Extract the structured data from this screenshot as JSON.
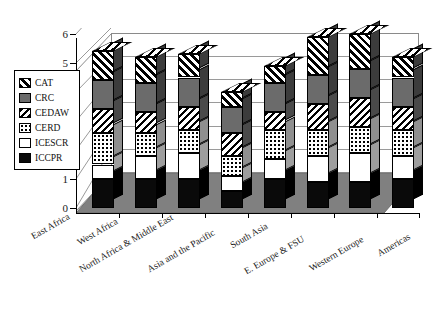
{
  "chart_data": {
    "type": "bar",
    "subtype": "stacked-bar-3d",
    "title": "",
    "subtitle": "",
    "xlabel": "",
    "ylabel": "",
    "ylim": [
      0,
      6
    ],
    "yticks": [
      0,
      1,
      2,
      3,
      4,
      5,
      6
    ],
    "ytick_labels": [
      "0",
      "1",
      "2",
      "3",
      "4",
      "5",
      "6"
    ],
    "grid": true,
    "legend_position": "left",
    "categories": [
      "East Africa",
      "West Africa",
      "North Africa & Middle East",
      "Asia and the Pacific",
      "South Asia",
      "E. Europe & FSU",
      "Western Europe",
      "Americas"
    ],
    "series": [
      {
        "name": "ICCPR",
        "fill": "solid-black",
        "values": [
          1.0,
          1.0,
          1.0,
          0.6,
          1.0,
          0.9,
          0.9,
          1.0
        ]
      },
      {
        "name": "ICESCR",
        "fill": "solid-white",
        "values": [
          0.5,
          0.8,
          0.9,
          0.5,
          0.7,
          0.9,
          1.0,
          0.8
        ]
      },
      {
        "name": "CERD",
        "fill": "dotted",
        "values": [
          1.1,
          0.8,
          0.8,
          0.7,
          1.0,
          0.9,
          0.9,
          0.9
        ]
      },
      {
        "name": "CEDAW",
        "fill": "diagonal-down",
        "values": [
          0.8,
          0.7,
          0.8,
          0.8,
          0.6,
          0.9,
          1.0,
          0.8
        ]
      },
      {
        "name": "CRC",
        "fill": "solid-gray",
        "values": [
          1.0,
          1.0,
          1.0,
          0.9,
          1.0,
          1.0,
          1.0,
          1.0
        ]
      },
      {
        "name": "CAT",
        "fill": "diagonal-up",
        "values": [
          1.0,
          0.9,
          0.8,
          0.5,
          0.6,
          1.3,
          1.2,
          0.7
        ]
      }
    ],
    "totals": [
      5.4,
      5.2,
      5.3,
      4.0,
      4.9,
      5.9,
      6.0,
      5.2
    ],
    "legend": [
      {
        "label": "CAT",
        "fill": "diagonal-up",
        "color": "#000000"
      },
      {
        "label": "CRC",
        "fill": "solid-gray",
        "color": "#6b6b6b"
      },
      {
        "label": "CEDAW",
        "fill": "diagonal-down",
        "color": "#000000"
      },
      {
        "label": "CERD",
        "fill": "dotted",
        "color": "#000000"
      },
      {
        "label": "ICESCR",
        "fill": "solid-white",
        "color": "#ffffff"
      },
      {
        "label": "ICCPR",
        "fill": "solid-black",
        "color": "#0a0a0a"
      }
    ],
    "colors": {
      "axis": "#000000",
      "grid": "#9a9a9a",
      "wall": "#ffffff",
      "floor": "#808080",
      "bar_side": "#5a5a5a",
      "background": "#ffffff"
    }
  }
}
